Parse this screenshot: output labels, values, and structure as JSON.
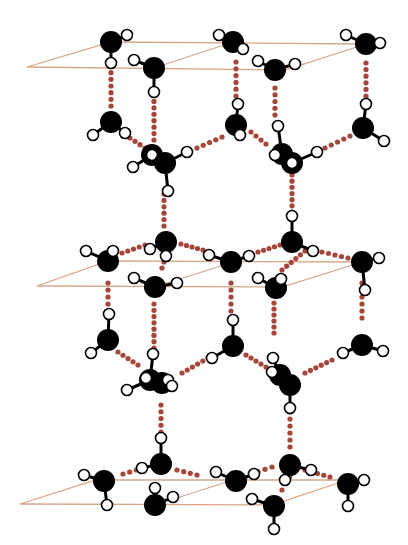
{
  "colors": {
    "background": "#ffffff",
    "oxygen": "#000000",
    "hydrogen_fill": "#ffffff",
    "hydrogen_stroke": "#000000",
    "hbond": "#a5463a",
    "plane": "#d8a688"
  },
  "legend_semantics": {
    "oxygen": "black sphere = oxygen atom",
    "hydrogen": "white sphere = hydrogen atom",
    "hbond": "dotted red line = hydrogen bond",
    "plane": "tan parallelogram = basal plane"
  },
  "planes": [
    {
      "name": "top-plane",
      "points": [
        [
          27,
          67
        ],
        [
          111,
          42
        ],
        [
          366,
          44
        ],
        [
          285,
          70
        ]
      ]
    },
    {
      "name": "middle-plane",
      "points": [
        [
          37,
          286
        ],
        [
          108,
          261
        ],
        [
          362,
          262
        ],
        [
          282,
          287
        ]
      ]
    },
    {
      "name": "bottom-plane",
      "points": [
        [
          20,
          504
        ],
        [
          96,
          480
        ],
        [
          347,
          480
        ],
        [
          272,
          505
        ]
      ]
    }
  ],
  "plane_inner_lines": [
    [
      [
        154,
        68
      ],
      [
        233,
        42
      ]
    ],
    [
      [
        155,
        287
      ],
      [
        233,
        262
      ]
    ],
    [
      [
        155,
        505
      ],
      [
        233,
        480
      ]
    ]
  ],
  "molecules": [
    {
      "o": [
        111,
        42
      ],
      "h": [
        [
          127,
          35
        ],
        [
          111,
          63
        ]
      ]
    },
    {
      "o": [
        233,
        42
      ],
      "h": [
        [
          219,
          35
        ],
        [
          243,
          49
        ]
      ]
    },
    {
      "o": [
        366,
        44
      ],
      "h": [
        [
          346,
          35
        ],
        [
          380,
          43
        ]
      ]
    },
    {
      "o": [
        154,
        68
      ],
      "h": [
        [
          134,
          60
        ],
        [
          154,
          92
        ]
      ]
    },
    {
      "o": [
        275,
        70
      ],
      "h": [
        [
          258,
          61
        ],
        [
          295,
          64
        ]
      ]
    },
    {
      "o": [
        111,
        122
      ],
      "h": [
        [
          93,
          135
        ],
        [
          125,
          133
        ]
      ]
    },
    {
      "o": [
        236,
        125
      ],
      "h": [
        [
          238,
          104
        ],
        [
          240,
          135
        ]
      ]
    },
    {
      "o": [
        363,
        128
      ],
      "h": [
        [
          366,
          104
        ],
        [
          384,
          141
        ]
      ]
    },
    {
      "o": [
        152,
        155
      ],
      "h": [
        [
          133,
          167
        ],
        [
          152,
          155
        ]
      ]
    },
    {
      "o": [
        165,
        163
      ],
      "h": [
        [
          187,
          152
        ],
        [
          168,
          191
        ]
      ]
    },
    {
      "o": [
        282,
        154
      ],
      "h": [
        [
          278,
          126
        ],
        [
          275,
          155
        ]
      ]
    },
    {
      "o": [
        292,
        163
      ],
      "h": [
        [
          317,
          152
        ],
        [
          292,
          163
        ]
      ]
    },
    {
      "o": [
        166,
        242
      ],
      "h": [
        [
          150,
          249
        ],
        [
          166,
          256
        ]
      ]
    },
    {
      "o": [
        292,
        242
      ],
      "h": [
        [
          292,
          216
        ],
        [
          313,
          251
        ]
      ]
    },
    {
      "o": [
        108,
        261
      ],
      "h": [
        [
          86,
          251
        ],
        [
          113,
          251
        ]
      ]
    },
    {
      "o": [
        231,
        262
      ],
      "h": [
        [
          209,
          255
        ],
        [
          249,
          256
        ]
      ]
    },
    {
      "o": [
        362,
        262
      ],
      "h": [
        [
          379,
          258
        ],
        [
          365,
          290
        ]
      ]
    },
    {
      "o": [
        155,
        287
      ],
      "h": [
        [
          134,
          278
        ],
        [
          177,
          283
        ]
      ]
    },
    {
      "o": [
        276,
        288
      ],
      "h": [
        [
          258,
          278
        ],
        [
          281,
          279
        ]
      ]
    },
    {
      "o": [
        108,
        340
      ],
      "h": [
        [
          109,
          314
        ],
        [
          91,
          353
        ]
      ]
    },
    {
      "o": [
        233,
        346
      ],
      "h": [
        [
          233,
          320
        ],
        [
          212,
          358
        ]
      ]
    },
    {
      "o": [
        362,
        345
      ],
      "h": [
        [
          343,
          353
        ],
        [
          383,
          351
        ]
      ]
    },
    {
      "o": [
        150,
        380
      ],
      "h": [
        [
          153,
          354
        ],
        [
          127,
          390
        ],
        [
          146,
          378
        ]
      ]
    },
    {
      "o": [
        162,
        383
      ],
      "h": [
        [
          168,
          380
        ],
        [
          172,
          386
        ]
      ]
    },
    {
      "o": [
        280,
        375
      ],
      "h": [
        [
          273,
          358
        ],
        [
          272,
          372
        ]
      ]
    },
    {
      "o": [
        290,
        385
      ],
      "h": [
        [
          290,
          408
        ]
      ]
    },
    {
      "o": [
        161,
        464
      ],
      "h": [
        [
          161,
          438
        ],
        [
          142,
          468
        ]
      ]
    },
    {
      "o": [
        290,
        465
      ],
      "h": [
        [
          311,
          470
        ],
        [
          285,
          480
        ]
      ]
    },
    {
      "o": [
        104,
        481
      ],
      "h": [
        [
          84,
          475
        ],
        [
          107,
          505
        ]
      ]
    },
    {
      "o": [
        236,
        481
      ],
      "h": [
        [
          216,
          472
        ],
        [
          254,
          474
        ]
      ]
    },
    {
      "o": [
        348,
        484
      ],
      "h": [
        [
          364,
          480
        ],
        [
          348,
          506
        ]
      ]
    },
    {
      "o": [
        155,
        505
      ],
      "h": [
        [
          155,
          488
        ],
        [
          173,
          497
        ]
      ]
    },
    {
      "o": [
        274,
        506
      ],
      "h": [
        [
          252,
          499
        ],
        [
          274,
          529
        ]
      ]
    }
  ],
  "hbonds": [
    [
      [
        111,
        66
      ],
      [
        111,
        106
      ]
    ],
    [
      [
        154,
        95
      ],
      [
        154,
        140
      ]
    ],
    [
      [
        236,
        62
      ],
      [
        236,
        96
      ]
    ],
    [
      [
        275,
        88
      ],
      [
        275,
        115
      ]
    ],
    [
      [
        366,
        63
      ],
      [
        366,
        96
      ]
    ],
    [
      [
        130,
        138
      ],
      [
        145,
        148
      ]
    ],
    [
      [
        197,
        148
      ],
      [
        222,
        137
      ]
    ],
    [
      [
        251,
        132
      ],
      [
        266,
        144
      ]
    ],
    [
      [
        325,
        148
      ],
      [
        350,
        136
      ]
    ],
    [
      [
        164,
        194
      ],
      [
        164,
        226
      ]
    ],
    [
      [
        292,
        175
      ],
      [
        292,
        212
      ]
    ],
    [
      [
        166,
        256
      ],
      [
        162,
        268
      ]
    ],
    [
      [
        122,
        253
      ],
      [
        145,
        245
      ]
    ],
    [
      [
        181,
        244
      ],
      [
        203,
        250
      ]
    ],
    [
      [
        258,
        252
      ],
      [
        280,
        245
      ]
    ],
    [
      [
        305,
        251
      ],
      [
        282,
        270
      ]
    ],
    [
      [
        322,
        252
      ],
      [
        348,
        258
      ]
    ],
    [
      [
        108,
        283
      ],
      [
        108,
        318
      ]
    ],
    [
      [
        231,
        283
      ],
      [
        231,
        311
      ]
    ],
    [
      [
        154,
        304
      ],
      [
        154,
        348
      ]
    ],
    [
      [
        274,
        303
      ],
      [
        274,
        333
      ]
    ],
    [
      [
        362,
        283
      ],
      [
        362,
        318
      ]
    ],
    [
      [
        118,
        352
      ],
      [
        138,
        365
      ]
    ],
    [
      [
        182,
        373
      ],
      [
        208,
        358
      ]
    ],
    [
      [
        246,
        355
      ],
      [
        266,
        367
      ]
    ],
    [
      [
        305,
        373
      ],
      [
        332,
        360
      ]
    ],
    [
      [
        161,
        405
      ],
      [
        161,
        432
      ]
    ],
    [
      [
        290,
        412
      ],
      [
        290,
        447
      ]
    ],
    [
      [
        123,
        474
      ],
      [
        143,
        468
      ]
    ],
    [
      [
        177,
        470
      ],
      [
        197,
        475
      ]
    ],
    [
      [
        251,
        474
      ],
      [
        272,
        467
      ]
    ],
    [
      [
        305,
        470
      ],
      [
        330,
        477
      ]
    ],
    [
      [
        290,
        476
      ],
      [
        282,
        490
      ]
    ]
  ]
}
